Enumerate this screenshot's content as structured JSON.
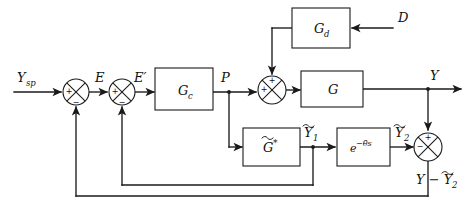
{
  "diagram": {
    "type": "control-block-diagram",
    "stroke_color": "#1a1a1a",
    "background_color": "#ffffff",
    "blocks": [
      {
        "id": "gc",
        "label": "G",
        "sub": "c",
        "tilde": false,
        "star": false,
        "x": 155,
        "y": 68,
        "w": 58,
        "h": 42
      },
      {
        "id": "gd",
        "label": "G",
        "sub": "d",
        "tilde": false,
        "star": false,
        "x": 292,
        "y": 8,
        "w": 58,
        "h": 40
      },
      {
        "id": "g",
        "label": "G",
        "sub": "",
        "tilde": false,
        "star": false,
        "x": 301,
        "y": 71,
        "w": 62,
        "h": 36
      },
      {
        "id": "gstar",
        "label": "G",
        "sub": "",
        "tilde": true,
        "star": true,
        "x": 243,
        "y": 128,
        "w": 57,
        "h": 38
      },
      {
        "id": "delay",
        "label": "e",
        "sub": "",
        "tilde": false,
        "star": false,
        "x": 337,
        "y": 128,
        "w": 53,
        "h": 38,
        "exponent": "−θ̄s"
      }
    ],
    "junctions": [
      {
        "id": "sum1",
        "cx": 76,
        "cy": 92,
        "r": 13,
        "signs": {
          "left": "+",
          "bottom": "−"
        }
      },
      {
        "id": "sum2",
        "cx": 122,
        "cy": 92,
        "r": 13,
        "signs": {
          "left": "+",
          "bottom": "−"
        }
      },
      {
        "id": "sum3",
        "cx": 272,
        "cy": 90,
        "r": 14,
        "signs": {
          "left": "+",
          "top": "+"
        }
      },
      {
        "id": "sum4",
        "cx": 428,
        "cy": 147,
        "r": 14,
        "signs": {
          "left": "−",
          "top": "+"
        }
      }
    ],
    "signals": [
      {
        "id": "ysp",
        "text": "Y",
        "sub": "sp",
        "x": 17,
        "y": 80
      },
      {
        "id": "e",
        "text": "E",
        "sub": "",
        "x": 96,
        "y": 80
      },
      {
        "id": "eprime",
        "text": "E′",
        "sub": "",
        "x": 135,
        "y": 80
      },
      {
        "id": "p",
        "text": "P",
        "sub": "",
        "x": 222,
        "y": 80
      },
      {
        "id": "d",
        "text": "D",
        "sub": "",
        "x": 401,
        "y": 20
      },
      {
        "id": "y",
        "text": "Y",
        "sub": "",
        "x": 432,
        "y": 78
      },
      {
        "id": "y1tilde",
        "text": "Y",
        "sub": "1",
        "tilde": true,
        "x": 306,
        "y": 127
      },
      {
        "id": "y2tilde",
        "text": "Y",
        "sub": "2",
        "tilde": true,
        "x": 397,
        "y": 127
      },
      {
        "id": "ydiff",
        "text": "Y − Y",
        "sub": "2",
        "tilde_on_second": true,
        "x": 418,
        "y": 182
      }
    ],
    "paths": {
      "input_to_sum1": "Y_sp enters first summing junction",
      "sum1_to_sum2": "E signal",
      "sum2_to_gc": "E-prime into controller",
      "gc_to_sum3": "P into process summing junction",
      "p_branch_to_gstar": "P branches down into model G-tilde-star",
      "gd_to_sum3": "disturbance path into summing junction",
      "d_into_gd": "disturbance input D",
      "sum3_to_g": "into process G",
      "g_to_y": "process output Y",
      "y_branch_to_sum4": "Y branches down to final summing junction",
      "gstar_to_delay": "Y1-tilde into time delay",
      "gstar_branch_inner_feedback": "Y1-tilde feeds back to second summing junction",
      "delay_to_sum4": "Y2-tilde into final summing junction",
      "sum4_to_outer_feedback": "Y minus Y2-tilde feeds back to first summing junction"
    }
  }
}
